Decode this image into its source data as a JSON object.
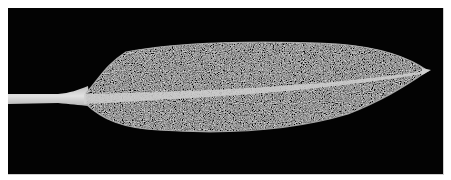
{
  "image": {
    "subject": "leaf",
    "description": "Single elongated lanceolate leaf with petiole on black background",
    "background_color": "#030303",
    "border_color": "#ffffff",
    "leaf_colors": {
      "blade_base": "#5a5a5a",
      "blade_speckle_light": "#c8c8c8",
      "blade_speckle_dark": "#2a2a2a",
      "midrib": "#cfcfcf",
      "petiole": "#d8d8d8",
      "margin": "#bdbdbd"
    }
  }
}
